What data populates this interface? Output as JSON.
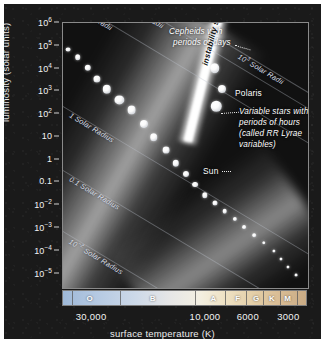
{
  "figure": {
    "type": "hertzsprung-russell-diagram",
    "background_color": "#1a1a1a",
    "panel_color": "#141414"
  },
  "chart_data": {
    "type": "scatter",
    "title": "",
    "xlabel": "surface temperature (K)",
    "ylabel": "luminosity (solar units)",
    "x_axis": {
      "scale": "log-reversed",
      "tick_labels": [
        "30,000",
        "10,000",
        "6000",
        "3000"
      ],
      "tick_values": [
        30000,
        10000,
        6000,
        3000
      ],
      "tick_positions_pct": [
        13.5,
        60.0,
        77.5,
        94.0
      ],
      "range": [
        50000,
        2200
      ]
    },
    "y_axis": {
      "scale": "log",
      "tick_labels": [
        "10⁶",
        "10⁵",
        "10⁴",
        "10³",
        "10²",
        "10",
        "1",
        "0.1",
        "10⁻²",
        "10⁻³",
        "10⁻⁴",
        "10⁻⁵"
      ],
      "tick_mantissas": [
        "10",
        "10",
        "10",
        "10",
        "10",
        "10",
        "1",
        "0.1",
        "10",
        "10",
        "10",
        "10"
      ],
      "tick_exponents": [
        "6",
        "5",
        "4",
        "3",
        "2",
        "",
        "",
        "",
        "−2",
        "−3",
        "−4",
        "−5"
      ],
      "tick_values": [
        1000000,
        100000,
        10000,
        1000,
        100,
        10,
        1,
        0.1,
        0.01,
        0.001,
        0.0001,
        1e-05
      ],
      "range": [
        3000000,
        3e-06
      ],
      "grid": false
    },
    "spectral_classes": {
      "label": "spectral class",
      "classes": [
        "O",
        "B",
        "A",
        "F",
        "G",
        "K",
        "M"
      ],
      "label_positions_pct": [
        11,
        37,
        62,
        72,
        79.5,
        86,
        92.5
      ],
      "boundary_positions_pct": [
        3.5,
        23.5,
        54.5,
        66.5,
        75.5,
        82.5,
        89.5,
        96.5
      ],
      "colors": [
        "#9fb9d8",
        "#c0d0e4",
        "#e6e6e6",
        "#f3efe2",
        "#efe3c6",
        "#e0c79e",
        "#cfae87"
      ]
    },
    "radius_lines": [
      {
        "label": "10³ Solar Radii",
        "mantissa": "10",
        "exponent": "3",
        "suffix": " Solar Radii"
      },
      {
        "label": "10 Solar Radii",
        "mantissa": "10",
        "exponent": "",
        "suffix": " Solar Radii"
      },
      {
        "label": "1 Solar Radius",
        "mantissa": "1",
        "exponent": "",
        "suffix": " Solar Radius"
      },
      {
        "label": "0.1 Solar Radius",
        "mantissa": "0.1",
        "exponent": "",
        "suffix": " Solar Radius"
      },
      {
        "label": "10⁻² Solar Radius",
        "mantissa": "10",
        "exponent": "−2",
        "suffix": " Solar Radius"
      },
      {
        "label": "10⁻³ Solar Radius",
        "mantissa": "10",
        "exponent": "−3",
        "suffix": " Solar Radius"
      },
      {
        "label": "10³ Solar Radii",
        "mantissa": "10",
        "exponent": "3",
        "suffix": " Solar Radii"
      }
    ],
    "annotations": [
      {
        "name": "cepheids",
        "lines": [
          "Cepheids with",
          "periods of days"
        ]
      },
      {
        "name": "instability-strip",
        "lines": [
          "instability strip"
        ]
      },
      {
        "name": "polaris",
        "lines": [
          "Polaris"
        ]
      },
      {
        "name": "rr-lyrae",
        "lines": [
          "Variable stars with",
          "periods of hours",
          "(called RR Lyrae",
          "variables)"
        ]
      },
      {
        "name": "sun",
        "lines": [
          "Sun"
        ]
      }
    ],
    "star_points": [
      {
        "x_pct": 2,
        "y_pct": 10,
        "r": 2.4
      },
      {
        "x_pct": 6,
        "y_pct": 13,
        "r": 2.8
      },
      {
        "x_pct": 10,
        "y_pct": 17,
        "r": 3.2
      },
      {
        "x_pct": 14,
        "y_pct": 21,
        "r": 3.6
      },
      {
        "x_pct": 18,
        "y_pct": 25,
        "r": 4.2
      },
      {
        "x_pct": 23,
        "y_pct": 29,
        "r": 4.6
      },
      {
        "x_pct": 28,
        "y_pct": 33,
        "r": 4.4
      },
      {
        "x_pct": 33,
        "y_pct": 38,
        "r": 4.0
      },
      {
        "x_pct": 37,
        "y_pct": 43,
        "r": 3.8
      },
      {
        "x_pct": 42,
        "y_pct": 48,
        "r": 3.4
      },
      {
        "x_pct": 46,
        "y_pct": 53,
        "r": 3.2
      },
      {
        "x_pct": 50,
        "y_pct": 57,
        "r": 3.0
      },
      {
        "x_pct": 54,
        "y_pct": 61,
        "r": 2.9
      },
      {
        "x_pct": 58,
        "y_pct": 65,
        "r": 2.7
      },
      {
        "x_pct": 62,
        "y_pct": 68,
        "r": 2.5
      },
      {
        "x_pct": 66,
        "y_pct": 71,
        "r": 2.3
      },
      {
        "x_pct": 70,
        "y_pct": 74,
        "r": 2.1
      },
      {
        "x_pct": 74,
        "y_pct": 77,
        "r": 1.9
      },
      {
        "x_pct": 78,
        "y_pct": 80,
        "r": 1.8
      },
      {
        "x_pct": 82,
        "y_pct": 83,
        "r": 1.7
      },
      {
        "x_pct": 86,
        "y_pct": 86,
        "r": 1.6
      },
      {
        "x_pct": 89,
        "y_pct": 89,
        "r": 1.5
      },
      {
        "x_pct": 92,
        "y_pct": 92,
        "r": 1.5
      },
      {
        "x_pct": 95,
        "y_pct": 95,
        "r": 1.4
      },
      {
        "x_pct": 62,
        "y_pct": 17,
        "r": 4.8
      },
      {
        "x_pct": 65,
        "y_pct": 25,
        "r": 4.0
      }
    ],
    "polaris_point": {
      "x_pct": 62.5,
      "y_pct": 31.5,
      "r": 5.2
    }
  }
}
